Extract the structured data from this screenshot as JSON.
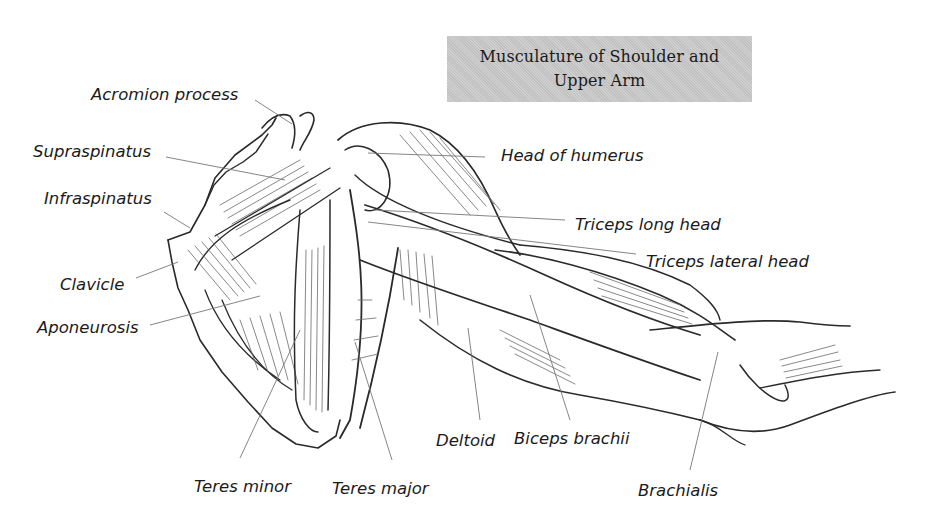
{
  "title": {
    "line1": "Musculature of Shoulder and",
    "line2": "Upper Arm",
    "background": "#c9c9c9"
  },
  "labels": [
    {
      "id": "acromion-process",
      "text": "Acromion process"
    },
    {
      "id": "supraspinatus",
      "text": "Supraspinatus"
    },
    {
      "id": "infraspinatus",
      "text": "Infraspinatus"
    },
    {
      "id": "clavicle",
      "text": "Clavicle"
    },
    {
      "id": "aponeurosis",
      "text": "Aponeurosis"
    },
    {
      "id": "head-of-humerus",
      "text": "Head of humerus"
    },
    {
      "id": "triceps-long-head",
      "text": "Triceps long head"
    },
    {
      "id": "triceps-lateral-head",
      "text": "Triceps lateral head"
    },
    {
      "id": "teres-minor",
      "text": "Teres minor"
    },
    {
      "id": "teres-major",
      "text": "Teres major"
    },
    {
      "id": "deltoid",
      "text": "Deltoid"
    },
    {
      "id": "biceps-brachii",
      "text": "Biceps brachii"
    },
    {
      "id": "brachialis",
      "text": "Brachialis"
    }
  ],
  "illustration": {
    "subject": "shoulder and upper arm muscles, pencil sketch",
    "line_color": "#2a2a2a",
    "leader_color": "#777777"
  }
}
